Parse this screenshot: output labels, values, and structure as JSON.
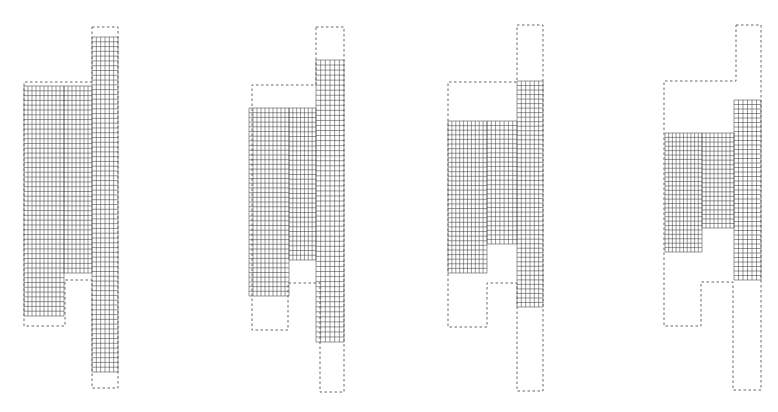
{
  "figure": {
    "colors": {
      "mesh": "#333333",
      "outline": "#555555",
      "background": "#ffffff"
    },
    "panels": [
      {
        "id": "stage-1",
        "outline": [
          [
            92,
            27
          ],
          [
            118,
            27
          ],
          [
            118,
            388
          ],
          [
            92,
            388
          ],
          [
            92,
            373
          ],
          [
            92,
            280
          ],
          [
            65,
            280
          ],
          [
            65,
            326
          ],
          [
            24,
            326
          ],
          [
            24,
            82
          ],
          [
            92,
            82
          ]
        ],
        "mesh_regions": [
          {
            "x": 24,
            "y": 86,
            "w": 40,
            "h": 230,
            "cols": 10,
            "rows": 48
          },
          {
            "x": 64,
            "y": 86,
            "w": 28,
            "h": 187,
            "cols": 7,
            "rows": 39
          },
          {
            "x": 92,
            "y": 37,
            "w": 26,
            "h": 335,
            "cols": 6,
            "rows": 70
          }
        ]
      },
      {
        "id": "stage-2",
        "outline": [
          [
            316,
            27
          ],
          [
            344,
            27
          ],
          [
            344,
            392
          ],
          [
            320,
            392
          ],
          [
            320,
            283
          ],
          [
            288,
            283
          ],
          [
            288,
            330
          ],
          [
            252,
            330
          ],
          [
            252,
            85
          ],
          [
            316,
            85
          ]
        ],
        "mesh_regions": [
          {
            "x": 249,
            "y": 108,
            "w": 40,
            "h": 188,
            "cols": 10,
            "rows": 40
          },
          {
            "x": 289,
            "y": 108,
            "w": 27,
            "h": 152,
            "cols": 7,
            "rows": 32
          },
          {
            "x": 316,
            "y": 60,
            "w": 28,
            "h": 282,
            "cols": 6,
            "rows": 56
          }
        ]
      },
      {
        "id": "stage-3",
        "outline": [
          [
            517,
            25
          ],
          [
            543,
            25
          ],
          [
            543,
            391
          ],
          [
            517,
            391
          ],
          [
            517,
            283
          ],
          [
            487,
            283
          ],
          [
            487,
            327
          ],
          [
            448,
            327
          ],
          [
            448,
            82
          ],
          [
            517,
            82
          ]
        ],
        "mesh_regions": [
          {
            "x": 448,
            "y": 121,
            "w": 39,
            "h": 152,
            "cols": 10,
            "rows": 33
          },
          {
            "x": 487,
            "y": 121,
            "w": 30,
            "h": 123,
            "cols": 7,
            "rows": 27
          },
          {
            "x": 517,
            "y": 81,
            "w": 26,
            "h": 226,
            "cols": 6,
            "rows": 50
          }
        ]
      },
      {
        "id": "stage-4",
        "outline": [
          [
            736,
            25
          ],
          [
            761,
            25
          ],
          [
            761,
            390
          ],
          [
            733,
            390
          ],
          [
            733,
            282
          ],
          [
            701,
            282
          ],
          [
            701,
            326
          ],
          [
            664,
            326
          ],
          [
            664,
            81
          ],
          [
            736,
            81
          ]
        ],
        "mesh_regions": [
          {
            "x": 665,
            "y": 133,
            "w": 37,
            "h": 119,
            "cols": 10,
            "rows": 27
          },
          {
            "x": 702,
            "y": 133,
            "w": 32,
            "h": 95,
            "cols": 8,
            "rows": 21
          },
          {
            "x": 734,
            "y": 100,
            "w": 27,
            "h": 180,
            "cols": 6,
            "rows": 40
          }
        ]
      }
    ]
  }
}
